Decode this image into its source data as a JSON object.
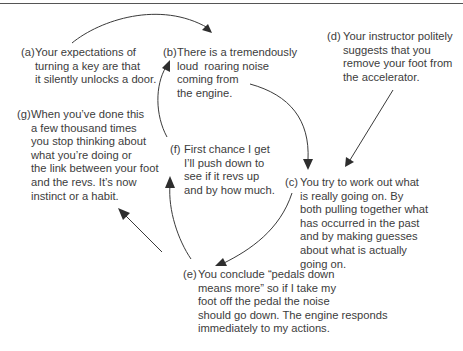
{
  "diagram": {
    "nodes": {
      "a": {
        "label": "(a)",
        "text": "Your expectations of\nturning a key are that\nit silently unlocks a door."
      },
      "b": {
        "label": "(b)",
        "text": "There is a tremendously\nloud  roaring noise\ncoming from\nthe engine."
      },
      "c": {
        "label": "(c)",
        "text": "You try to work out what\nis really going on. By\nboth pulling together what\nhas occurred in the past\nand by making guesses\nabout what is actually\ngoing on."
      },
      "d": {
        "label": "(d)",
        "text": "Your instructor politely\nsuggests that you\nremove your foot from\nthe accelerator."
      },
      "e": {
        "label": "(e)",
        "text": "You conclude “pedals down\nmeans more” so if I take my\nfoot off the pedal the noise\nshould go down. The engine responds\nimmediately to my actions."
      },
      "f": {
        "label": "(f)",
        "text": "First chance I get\nI’ll push down to\nsee if it revs up\nand by how much."
      },
      "g": {
        "label": "(g)",
        "text": "When you’ve done this\na few thousand times\nyou stop thinking about\nwhat you’re doing or\nthe link between your foot\nand the revs. It’s now\ninstinct or a habit."
      }
    },
    "edges": [
      {
        "from": "a",
        "to": "b"
      },
      {
        "from": "b",
        "to": "c"
      },
      {
        "from": "d",
        "to": "c"
      },
      {
        "from": "c",
        "to": "e"
      },
      {
        "from": "e",
        "to": "f"
      },
      {
        "from": "e",
        "to": "g"
      },
      {
        "from": "f",
        "to": "b"
      }
    ]
  }
}
